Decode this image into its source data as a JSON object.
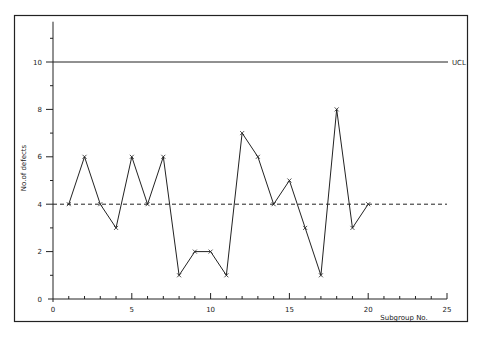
{
  "chart_data": {
    "type": "line",
    "title": "",
    "xlabel": "Subgroup No.",
    "ylabel": "No.of defects",
    "x": [
      1,
      2,
      3,
      4,
      5,
      6,
      7,
      8,
      9,
      10,
      11,
      12,
      13,
      14,
      15,
      16,
      17,
      18,
      19,
      20
    ],
    "series": [
      {
        "name": "defects",
        "marker": "x",
        "values": [
          4,
          6,
          4,
          3,
          6,
          4,
          6,
          1,
          2,
          2,
          1,
          7,
          6,
          4,
          5,
          3,
          1,
          8,
          3,
          4
        ]
      }
    ],
    "reference_lines": [
      {
        "name": "UCL",
        "value": 10,
        "style": "solid",
        "label": "UCL"
      },
      {
        "name": "centerline",
        "value": 4,
        "style": "dashed",
        "label": ""
      }
    ],
    "xlim": [
      0,
      25
    ],
    "ylim": [
      0,
      11.7
    ],
    "x_ticks": [
      "0",
      "5",
      "10",
      "15",
      "20",
      "25"
    ],
    "y_ticks": [
      "0",
      "2",
      "4",
      "6",
      "8",
      "10"
    ],
    "grid": false,
    "legend": "none"
  },
  "colors": {
    "line": "#222222",
    "frame": "#222222",
    "background": "#ffffff"
  }
}
